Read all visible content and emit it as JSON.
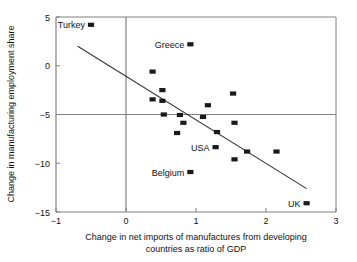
{
  "chart_data": {
    "type": "scatter",
    "title": "",
    "xlabel": "Change in net imports of manufactures from developing countries as ratio of GDP",
    "xlabel_line1": "Change in net imports of manufactures from developing",
    "xlabel_line2": "countries as ratio of GDP",
    "ylabel": "Change in manufacturing employment share",
    "xlim": [
      -1,
      3
    ],
    "ylim": [
      -15,
      5
    ],
    "xticks": [
      -1,
      0,
      1,
      2,
      3
    ],
    "xtick_labels": [
      "−1",
      "0",
      "1",
      "2",
      "3"
    ],
    "yticks": [
      5,
      0,
      -5,
      -10,
      -15
    ],
    "ytick_labels": [
      "5",
      "0",
      "−5",
      "−10",
      "−15"
    ],
    "grid": false,
    "zero_lines": [
      "y=0",
      "x=0"
    ],
    "legend": null,
    "marker": "filled-square",
    "marker_color": "#1a1a1a",
    "axis_color": "#808080",
    "trend_line": {
      "x1": -0.69,
      "y1": 2.0,
      "x2": 2.58,
      "y2": -12.6,
      "color": "#333333"
    },
    "points": [
      {
        "label": "Turkey",
        "x": -0.5,
        "y": 4.2,
        "label_side": "left"
      },
      {
        "label": "Greece",
        "x": 0.92,
        "y": 2.2,
        "label_side": "left"
      },
      {
        "label": null,
        "x": 0.38,
        "y": -0.6,
        "label_side": null
      },
      {
        "label": null,
        "x": 0.52,
        "y": -2.5,
        "label_side": null
      },
      {
        "label": null,
        "x": 0.38,
        "y": -3.45,
        "label_side": null
      },
      {
        "label": null,
        "x": 0.52,
        "y": -3.6,
        "label_side": null
      },
      {
        "label": null,
        "x": 0.54,
        "y": -5.0,
        "label_side": null
      },
      {
        "label": null,
        "x": 0.77,
        "y": -5.05,
        "label_side": null
      },
      {
        "label": null,
        "x": 0.82,
        "y": -5.85,
        "label_side": null
      },
      {
        "label": null,
        "x": 0.73,
        "y": -6.9,
        "label_side": null
      },
      {
        "label": null,
        "x": 1.17,
        "y": -4.05,
        "label_side": null
      },
      {
        "label": null,
        "x": 1.1,
        "y": -5.25,
        "label_side": null
      },
      {
        "label": null,
        "x": 1.3,
        "y": -6.8,
        "label_side": null
      },
      {
        "label": "USA",
        "x": 1.28,
        "y": -8.35,
        "label_side": "left"
      },
      {
        "label": null,
        "x": 1.53,
        "y": -2.85,
        "label_side": null
      },
      {
        "label": null,
        "x": 1.55,
        "y": -5.85,
        "label_side": null
      },
      {
        "label": null,
        "x": 1.55,
        "y": -9.6,
        "label_side": null
      },
      {
        "label": "Belgium",
        "x": 0.92,
        "y": -10.9,
        "label_side": "left"
      },
      {
        "label": null,
        "x": 1.73,
        "y": -8.8,
        "label_side": null
      },
      {
        "label": null,
        "x": 2.15,
        "y": -8.8,
        "label_side": null
      },
      {
        "label": "UK",
        "x": 2.58,
        "y": -14.1,
        "label_side": "left"
      }
    ]
  },
  "colors": {
    "marker": "#1a1a1a",
    "axis": "#808080",
    "trend": "#333333",
    "text": "#111111",
    "background": "#ffffff"
  }
}
